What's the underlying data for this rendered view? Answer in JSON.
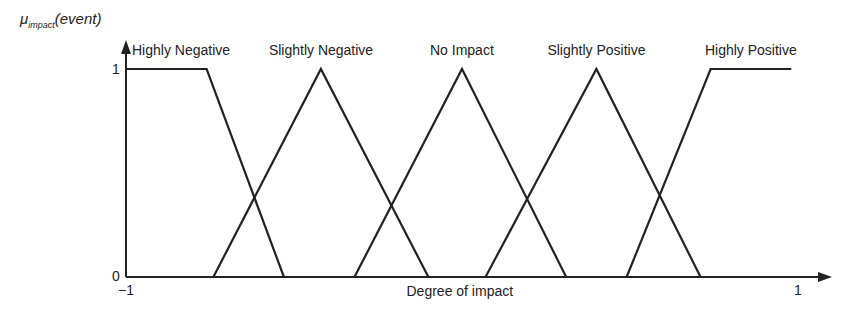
{
  "chart_data": {
    "type": "line",
    "title": "",
    "xlabel": "Degree of impact",
    "ylabel_main": "μ",
    "ylabel_sub": "impact",
    "ylabel_arg": "(event)",
    "xlim": [
      -1,
      1
    ],
    "ylim": [
      0,
      1
    ],
    "x_ticks": [
      "−1",
      "1"
    ],
    "y_ticks": [
      "0",
      "1"
    ],
    "grid": false,
    "series": [
      {
        "name": "Highly Negative",
        "points": [
          [
            -1,
            1
          ],
          [
            -0.76,
            1
          ],
          [
            -0.53,
            0
          ]
        ]
      },
      {
        "name": "Slightly Negative",
        "points": [
          [
            -0.74,
            0
          ],
          [
            -0.42,
            1
          ],
          [
            -0.1,
            0
          ]
        ]
      },
      {
        "name": "No Impact",
        "points": [
          [
            -0.32,
            0
          ],
          [
            0,
            1
          ],
          [
            0.31,
            0
          ]
        ]
      },
      {
        "name": "Slightly Positive",
        "points": [
          [
            0.07,
            0
          ],
          [
            0.4,
            1
          ],
          [
            0.71,
            0
          ]
        ]
      },
      {
        "name": "Highly Positive",
        "points": [
          [
            0.49,
            0
          ],
          [
            0.74,
            1
          ],
          [
            0.98,
            1
          ]
        ]
      }
    ]
  }
}
